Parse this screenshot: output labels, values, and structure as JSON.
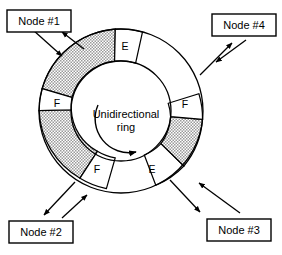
{
  "figure": {
    "center_label_line1": "Unidirectional",
    "center_label_line2": "ring",
    "rotation_direction": "clockwise",
    "background_color": "#ffffff",
    "line_color": "#000000",
    "shade_color": "#c8c8c8"
  },
  "nodes": [
    {
      "id": "node-1",
      "label": "Node #1",
      "position": "top-left"
    },
    {
      "id": "node-2",
      "label": "Node #2",
      "position": "bottom-left"
    },
    {
      "id": "node-3",
      "label": "Node #3",
      "position": "bottom-right"
    },
    {
      "id": "node-4",
      "label": "Node #4",
      "position": "top-right"
    }
  ],
  "ring_segments": [
    {
      "id": "segment-e-top",
      "label": "E",
      "fill": "white",
      "position": "top"
    },
    {
      "id": "segment-f-right",
      "label": "F",
      "fill": "white",
      "position": "right"
    },
    {
      "id": "segment-e-bottom-right",
      "label": "E",
      "fill": "white",
      "position": "bottom-right"
    },
    {
      "id": "segment-f-bottom-left",
      "label": "F",
      "fill": "white",
      "position": "bottom-left"
    },
    {
      "id": "segment-f-left",
      "label": "F",
      "fill": "white",
      "position": "left"
    },
    {
      "id": "segment-busy-upper-left",
      "label": "",
      "fill": "shaded",
      "position": "upper-left"
    },
    {
      "id": "segment-busy-lower-left",
      "label": "",
      "fill": "shaded",
      "position": "lower-left"
    },
    {
      "id": "segment-busy-right",
      "label": "",
      "fill": "shaded",
      "position": "right"
    }
  ]
}
